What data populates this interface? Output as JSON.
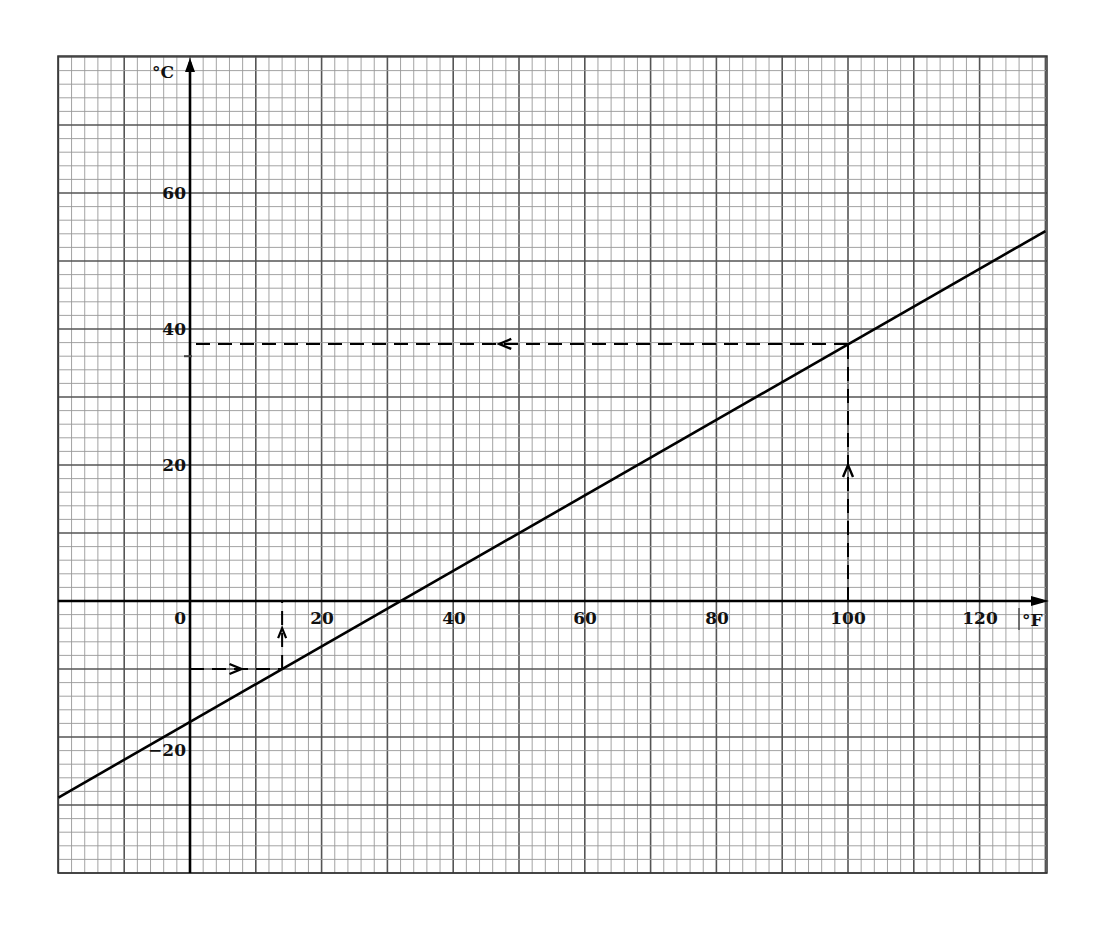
{
  "chart_data": {
    "type": "line",
    "title": "",
    "xlabel": "°F",
    "ylabel": "°C",
    "xlim": [
      -20,
      130
    ],
    "ylim": [
      -40,
      80
    ],
    "grid": true,
    "x_ticks": [
      0,
      20,
      40,
      60,
      80,
      100,
      120
    ],
    "x_tick_labels": [
      "0",
      "20",
      "40",
      "60",
      "80",
      "100",
      "120"
    ],
    "y_ticks": [
      60,
      40,
      20,
      -20
    ],
    "y_tick_labels": [
      "60",
      "40",
      "20",
      "−20"
    ],
    "series": [
      {
        "name": "C = 5/9 (F − 32)",
        "x": [
          -20,
          130
        ],
        "y": [
          -28.9,
          54.4
        ]
      }
    ],
    "annotations": [
      {
        "type": "dashed-arrow-path",
        "description": "From 100 °F up to line, then left to °C axis",
        "x_value": 100,
        "y_value": 37.8
      },
      {
        "type": "dashed-arrow-path",
        "description": "From −10 °C right to line, then up to °F axis",
        "y_value": -10,
        "x_value": 14
      }
    ]
  },
  "labels": {
    "x_axis_unit": "°F",
    "y_axis_unit": "°C",
    "x0": "0",
    "x20": "20",
    "x40": "40",
    "x60": "60",
    "x80": "80",
    "x100": "100",
    "x120": "120",
    "y60": "60",
    "y40": "40",
    "y20": "20",
    "yneg20": "−20"
  }
}
